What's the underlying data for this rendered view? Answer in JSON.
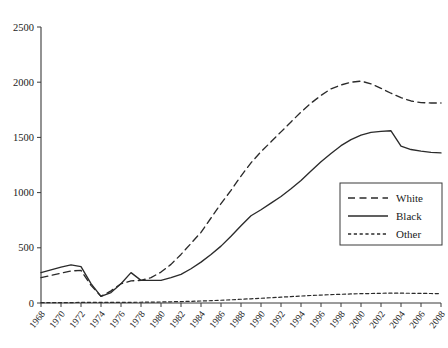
{
  "chart_data": {
    "type": "line",
    "title": "",
    "subtitle": "",
    "xlabel": "",
    "ylabel": "",
    "grid": false,
    "legend_position": "right-middle",
    "xlim": [
      1968,
      2008
    ],
    "ylim": [
      0,
      2500
    ],
    "yticks": [
      0,
      500,
      1000,
      1500,
      2000,
      2500
    ],
    "ytick_labels": [
      "0",
      "500",
      "1000",
      "1500",
      "2000",
      "2500"
    ],
    "x": [
      1968,
      1969,
      1970,
      1971,
      1972,
      1973,
      1974,
      1975,
      1976,
      1977,
      1978,
      1979,
      1980,
      1981,
      1982,
      1983,
      1984,
      1985,
      1986,
      1987,
      1988,
      1989,
      1990,
      1991,
      1992,
      1993,
      1994,
      1995,
      1996,
      1997,
      1998,
      1999,
      2000,
      2001,
      2002,
      2003,
      2004,
      2005,
      2006,
      2007,
      2008
    ],
    "xtick_labels": [
      "1968",
      "1970",
      "1972",
      "1974",
      "1976",
      "1978",
      "1980",
      "1982",
      "1984",
      "1986",
      "1988",
      "1990",
      "1992",
      "1994",
      "1996",
      "1998",
      "2000",
      "2002",
      "2004",
      "2006",
      "2008"
    ],
    "xticks": [
      1968,
      1970,
      1972,
      1974,
      1976,
      1978,
      1980,
      1982,
      1984,
      1986,
      1988,
      1990,
      1992,
      1994,
      1996,
      1998,
      2000,
      2002,
      2004,
      2006,
      2008
    ],
    "series": [
      {
        "name": "White",
        "style": "long-dashed",
        "color": "#2b2b2b",
        "values": [
          230,
          250,
          270,
          290,
          295,
          160,
          60,
          110,
          175,
          200,
          205,
          230,
          280,
          350,
          440,
          540,
          640,
          770,
          900,
          1020,
          1150,
          1270,
          1370,
          1460,
          1550,
          1640,
          1730,
          1810,
          1880,
          1940,
          1975,
          2000,
          2010,
          1985,
          1945,
          1900,
          1860,
          1830,
          1815,
          1812,
          1812
        ]
      },
      {
        "name": "Black",
        "style": "solid",
        "color": "#2b2b2b",
        "values": [
          275,
          300,
          325,
          345,
          330,
          175,
          60,
          95,
          175,
          275,
          205,
          205,
          205,
          230,
          260,
          310,
          370,
          440,
          515,
          605,
          700,
          790,
          845,
          905,
          965,
          1035,
          1110,
          1195,
          1280,
          1355,
          1425,
          1480,
          1520,
          1545,
          1555,
          1560,
          1420,
          1390,
          1375,
          1365,
          1360
        ]
      },
      {
        "name": "Other",
        "style": "short-dashed",
        "color": "#2b2b2b",
        "values": [
          3,
          3,
          4,
          4,
          5,
          5,
          5,
          5,
          6,
          6,
          7,
          8,
          9,
          11,
          13,
          15,
          18,
          21,
          25,
          29,
          34,
          38,
          43,
          48,
          53,
          58,
          63,
          68,
          72,
          76,
          79,
          82,
          85,
          86,
          88,
          89,
          89,
          88,
          87,
          86,
          85
        ]
      }
    ],
    "legend_entries": [
      "White",
      "Black",
      "Other"
    ]
  }
}
